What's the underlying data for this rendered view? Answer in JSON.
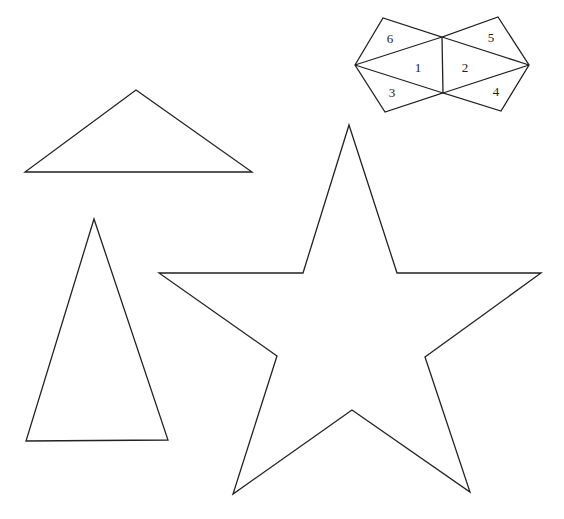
{
  "diagram": {
    "background": "#ffffff",
    "stroke_color": "#222222",
    "shapes": [
      {
        "id": "wide-triangle",
        "type": "polygon",
        "points": "136,90 252,172 25,172"
      },
      {
        "id": "tall-triangle",
        "type": "polygon",
        "points": "94,219 168,440 26,441"
      },
      {
        "id": "star",
        "type": "polygon",
        "points": "349,125 397,273 541,273 425,357 470,492 352,410 233,494 277,356 159,273 303,273"
      },
      {
        "id": "dissected-hexagon",
        "type": "group",
        "outline": "355,65 383,18 442,37 498,17 529,65 501,111 443,93 385,112",
        "lines": [
          "355,65 442,37",
          "355,65 443,93",
          "442,37 443,93",
          "442,37 529,65",
          "443,93 529,65"
        ],
        "pieces": [
          {
            "label": "6",
            "x": 390,
            "y": 43
          },
          {
            "label": "1",
            "x": 418,
            "y": 72
          },
          {
            "label": "3",
            "x": 392,
            "y": 97
          },
          {
            "label": "2",
            "x": 465,
            "y": 72
          },
          {
            "label": "5",
            "x": 491,
            "y": 42
          },
          {
            "label": "4",
            "x": 496,
            "y": 96
          }
        ]
      }
    ]
  }
}
